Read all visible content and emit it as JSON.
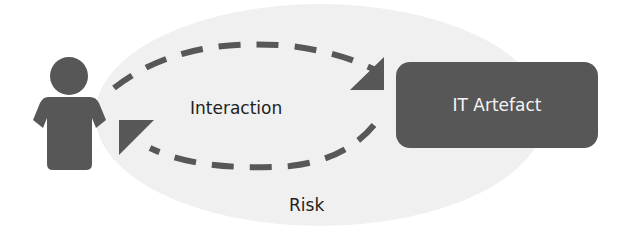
{
  "diagram": {
    "actor": {
      "icon": "person-icon"
    },
    "labels": {
      "interaction": "Interaction",
      "risk": "Risk"
    },
    "artefact": {
      "label": "IT Artefact"
    },
    "colors": {
      "shape": "#575757",
      "ellipse": "#f0f0f0",
      "text": "#222222",
      "box_text": "#f4f4f4"
    }
  }
}
